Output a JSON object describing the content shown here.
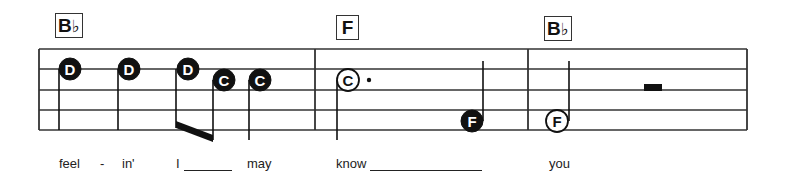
{
  "colors": {
    "ink": "#111111",
    "staff": "#333333",
    "background": "#ffffff"
  },
  "staff": {
    "left": 39,
    "right": 747,
    "lines_y": [
      49,
      69,
      90,
      110,
      130
    ],
    "barlines_x": [
      315,
      528
    ]
  },
  "chords": [
    {
      "root": "B",
      "accidental": "♭",
      "x": 55,
      "y": 13,
      "w": 28
    },
    {
      "root": "F",
      "accidental": "",
      "x": 336,
      "y": 15,
      "w": 23
    },
    {
      "root": "B",
      "accidental": "♭",
      "x": 544,
      "y": 16,
      "w": 28
    }
  ],
  "notes": [
    {
      "name": "D",
      "filled": true,
      "cx": 70,
      "cy": 69,
      "stem_x": 59,
      "stem_from": 69,
      "stem_to": 130
    },
    {
      "name": "D",
      "filled": true,
      "cx": 129,
      "cy": 69,
      "stem_x": 118,
      "stem_from": 69,
      "stem_to": 130
    },
    {
      "name": "D",
      "filled": true,
      "cx": 188,
      "cy": 69,
      "stem_x": 176,
      "stem_from": 69,
      "stem_to": 128
    },
    {
      "name": "C",
      "filled": true,
      "cx": 224,
      "cy": 80,
      "stem_x": 213,
      "stem_from": 80,
      "stem_to": 140
    },
    {
      "name": "C",
      "filled": true,
      "cx": 260,
      "cy": 80,
      "stem_x": 249,
      "stem_from": 80,
      "stem_to": 140
    },
    {
      "name": "C",
      "filled": false,
      "cx": 348,
      "cy": 80,
      "stem_x": 337,
      "stem_from": 80,
      "stem_to": 140,
      "dotted": true,
      "dot_x": 369
    },
    {
      "name": "F",
      "filled": true,
      "cx": 472,
      "cy": 121,
      "stem_x": 483,
      "stem_from": 121,
      "stem_to": 61
    },
    {
      "name": "F",
      "filled": false,
      "cx": 557,
      "cy": 121,
      "stem_x": 569,
      "stem_from": 121,
      "stem_to": 61
    }
  ],
  "beams": [
    {
      "x1": 176,
      "y1": 121,
      "x2": 213,
      "y2": 135,
      "thickness": 7
    }
  ],
  "rests": [
    {
      "type": "half-rest",
      "x": 644,
      "y": 84,
      "w": 18,
      "h": 7
    }
  ],
  "lyrics": [
    {
      "text": "feel",
      "x": 59
    },
    {
      "text": "-",
      "x": 100
    },
    {
      "text": "in'",
      "x": 122
    },
    {
      "text": "I",
      "x": 176
    },
    {
      "text": "may",
      "x": 247
    },
    {
      "text": "know",
      "x": 336
    },
    {
      "text": "you",
      "x": 549
    }
  ],
  "extenders": [
    {
      "x1": 184,
      "x2": 232
    },
    {
      "x1": 370,
      "x2": 482
    }
  ]
}
